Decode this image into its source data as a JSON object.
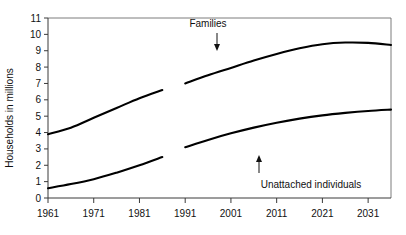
{
  "chart_data": {
    "type": "line",
    "title": "",
    "xlabel": "",
    "ylabel": "Households in millions",
    "xlim": [
      1961,
      2036
    ],
    "ylim": [
      0,
      11
    ],
    "grid": false,
    "legend_position": "inline-annotations",
    "x_ticks": [
      "1961",
      "1971",
      "1981",
      "1991",
      "2001",
      "2011",
      "2021",
      "2031"
    ],
    "x_tick_values": [
      1961,
      1971,
      1981,
      1991,
      2001,
      2011,
      2021,
      2031
    ],
    "y_ticks": [
      "0",
      "1",
      "2",
      "3",
      "4",
      "5",
      "6",
      "7",
      "8",
      "9",
      "10",
      "11"
    ],
    "y_tick_values": [
      0,
      1,
      2,
      3,
      4,
      5,
      6,
      7,
      8,
      9,
      10,
      11
    ],
    "annotations": [
      {
        "text": "Families",
        "points_to": "families-series",
        "arrow": "down"
      },
      {
        "text": "Unattached individuals",
        "points_to": "unattached-series",
        "arrow": "up"
      }
    ],
    "series": [
      {
        "name": "Families",
        "segment": "historical",
        "x": [
          1961,
          1966,
          1971,
          1976,
          1981,
          1986
        ],
        "values": [
          3.9,
          4.3,
          4.9,
          5.5,
          6.1,
          6.6
        ]
      },
      {
        "name": "Families",
        "segment": "projected",
        "x": [
          1991,
          1996,
          2001,
          2006,
          2011,
          2016,
          2021,
          2026,
          2031,
          2036
        ],
        "values": [
          7.0,
          7.5,
          7.95,
          8.4,
          8.8,
          9.15,
          9.4,
          9.5,
          9.48,
          9.35
        ]
      },
      {
        "name": "Unattached individuals",
        "segment": "historical",
        "x": [
          1961,
          1966,
          1971,
          1976,
          1981,
          1986
        ],
        "values": [
          0.6,
          0.85,
          1.15,
          1.55,
          2.0,
          2.5
        ]
      },
      {
        "name": "Unattached individuals",
        "segment": "projected",
        "x": [
          1991,
          1996,
          2001,
          2006,
          2011,
          2016,
          2021,
          2026,
          2031,
          2036
        ],
        "values": [
          3.1,
          3.55,
          3.95,
          4.3,
          4.6,
          4.85,
          5.05,
          5.2,
          5.32,
          5.4
        ]
      }
    ]
  },
  "axis": {
    "y_title": "Households in millions"
  },
  "annotations": {
    "families_label": "Families",
    "unattached_label": "Unattached individuals"
  }
}
